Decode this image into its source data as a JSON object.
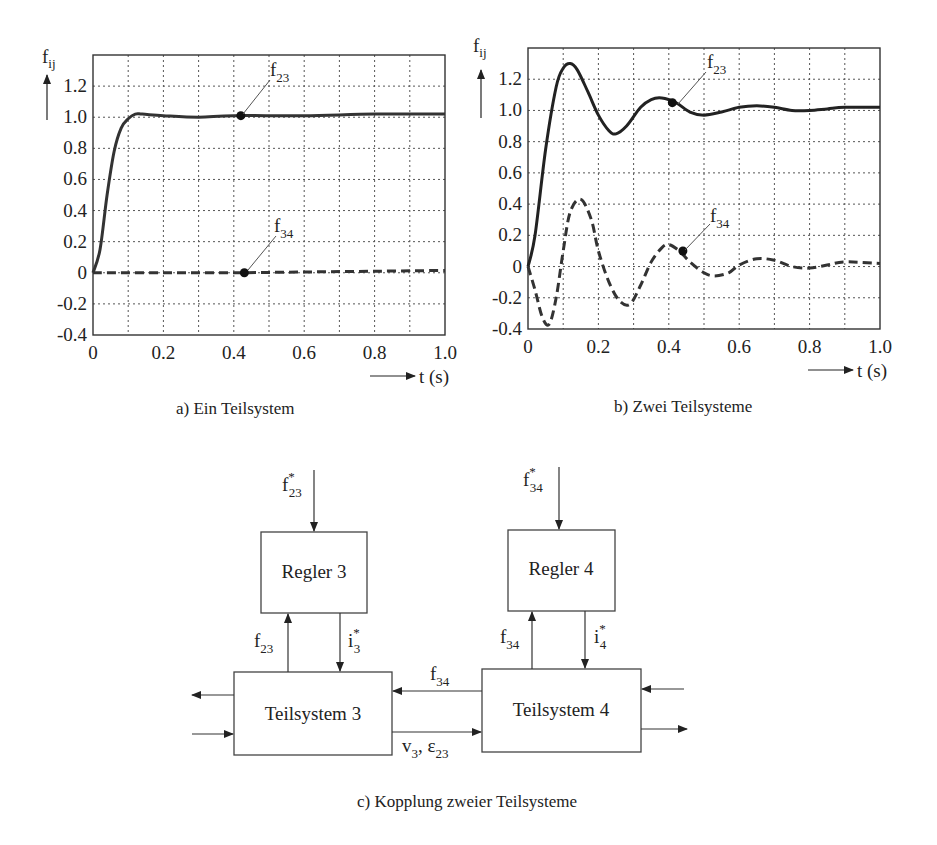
{
  "chart_data": [
    {
      "type": "line",
      "title": "a) Ein Teilsystem",
      "xlabel": "t (s)",
      "ylabel": "f_ij",
      "xlim": [
        0,
        1.0
      ],
      "ylim": [
        -0.4,
        1.4
      ],
      "xticks": [
        "0",
        "0.2",
        "0.4",
        "0.6",
        "0.8",
        "1.0"
      ],
      "yticks": [
        "1.2",
        "1.0",
        "0.8",
        "0.6",
        "0.4",
        "0.2",
        "0",
        "-0.2",
        "-0.4"
      ],
      "grid": true,
      "series": [
        {
          "name": "f23",
          "style": "solid",
          "x": [
            0,
            0.02,
            0.04,
            0.06,
            0.08,
            0.1,
            0.12,
            0.14,
            0.2,
            0.3,
            0.4,
            0.6,
            0.8,
            1.0
          ],
          "y": [
            0,
            0.15,
            0.5,
            0.78,
            0.93,
            0.99,
            1.02,
            1.02,
            1.01,
            1.0,
            1.01,
            1.01,
            1.02,
            1.02
          ],
          "marker": {
            "x": 0.42,
            "y": 1.01
          }
        },
        {
          "name": "f34",
          "style": "dashed",
          "x": [
            0,
            0.2,
            0.4,
            0.6,
            0.8,
            1.0
          ],
          "y": [
            0,
            0,
            0,
            0.005,
            0.01,
            0.015
          ],
          "marker": {
            "x": 0.43,
            "y": 0.0
          }
        }
      ]
    },
    {
      "type": "line",
      "title": "b) Zwei Teilsysteme",
      "xlabel": "t (s)",
      "ylabel": "f_ij",
      "xlim": [
        0,
        1.0
      ],
      "ylim": [
        -0.4,
        1.4
      ],
      "xticks": [
        "0",
        "0.2",
        "0.4",
        "0.6",
        "0.8",
        "1.0"
      ],
      "yticks": [
        "1.2",
        "1.0",
        "0.8",
        "0.6",
        "0.4",
        "0.2",
        "0",
        "-0.2",
        "-0.4"
      ],
      "grid": true,
      "series": [
        {
          "name": "f23",
          "style": "solid",
          "x": [
            0,
            0.02,
            0.05,
            0.08,
            0.1,
            0.12,
            0.14,
            0.17,
            0.2,
            0.23,
            0.25,
            0.28,
            0.32,
            0.35,
            0.38,
            0.42,
            0.46,
            0.5,
            0.55,
            0.6,
            0.65,
            0.7,
            0.75,
            0.8,
            0.85,
            0.9,
            1.0
          ],
          "y": [
            0,
            0.2,
            0.75,
            1.15,
            1.27,
            1.3,
            1.26,
            1.12,
            0.97,
            0.87,
            0.85,
            0.9,
            1.02,
            1.07,
            1.08,
            1.05,
            0.99,
            0.97,
            0.99,
            1.02,
            1.03,
            1.02,
            1.0,
            1.0,
            1.01,
            1.02,
            1.02
          ],
          "marker": {
            "x": 0.41,
            "y": 1.05
          }
        },
        {
          "name": "f34",
          "style": "dashed",
          "x": [
            0,
            0.02,
            0.04,
            0.06,
            0.08,
            0.1,
            0.12,
            0.15,
            0.18,
            0.2,
            0.23,
            0.26,
            0.29,
            0.32,
            0.35,
            0.38,
            0.4,
            0.43,
            0.46,
            0.5,
            0.53,
            0.57,
            0.6,
            0.65,
            0.7,
            0.75,
            0.8,
            0.85,
            0.9,
            1.0
          ],
          "y": [
            0,
            -0.15,
            -0.32,
            -0.37,
            -0.2,
            0.1,
            0.35,
            0.43,
            0.3,
            0.1,
            -0.1,
            -0.22,
            -0.24,
            -0.12,
            0.03,
            0.12,
            0.14,
            0.1,
            0.03,
            -0.04,
            -0.06,
            -0.04,
            0.01,
            0.05,
            0.04,
            0.0,
            -0.01,
            0.01,
            0.03,
            0.02
          ],
          "marker": {
            "x": 0.44,
            "y": 0.1
          }
        }
      ]
    }
  ],
  "plot_a": {
    "y_axis_label": "f",
    "y_axis_sub": "ij",
    "x_axis_label": "t (s)",
    "ann_f23": "f",
    "ann_f23_sub": "23",
    "ann_f34": "f",
    "ann_f34_sub": "34",
    "caption": "a) Ein Teilsystem"
  },
  "plot_b": {
    "y_axis_label": "f",
    "y_axis_sub": "ij",
    "x_axis_label": "t (s)",
    "ann_f23": "f",
    "ann_f23_sub": "23",
    "ann_f34": "f",
    "ann_f34_sub": "34",
    "caption": "b) Zwei Teilsysteme"
  },
  "diagram": {
    "regler3": "Regler 3",
    "regler4": "Regler 4",
    "teil3": "Teilsystem 3",
    "teil4": "Teilsystem 4",
    "f23_ref": "f",
    "f23_ref_sub": "23",
    "f23_ref_sup": "*",
    "f34_ref": "f",
    "f34_ref_sub": "34",
    "f34_ref_sup": "*",
    "f23_fb": "f",
    "f23_fb_sub": "23",
    "i3": "i",
    "i3_sub": "3",
    "i3_sup": "*",
    "f34_fb": "f",
    "f34_fb_sub": "34",
    "i4": "i",
    "i4_sub": "4",
    "i4_sup": "*",
    "f34_couple": "f",
    "f34_couple_sub": "34",
    "v3": "v",
    "v3_sub": "3",
    "eps": ", ε",
    "eps_sub": "23",
    "caption": "c) Kopplung zweier Teilsysteme"
  }
}
